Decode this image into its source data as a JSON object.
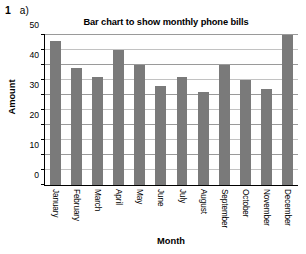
{
  "page": {
    "top_cut_text": "AAAAAA",
    "question_number": "1",
    "question_part": "a)"
  },
  "chart_data": {
    "type": "bar",
    "title": "Bar chart to show monthly phone bills",
    "xlabel": "Month",
    "ylabel": "Amount",
    "categories": [
      "January",
      "February",
      "March",
      "April",
      "May",
      "June",
      "July",
      "August",
      "September",
      "October",
      "November",
      "December"
    ],
    "values": [
      48,
      39,
      36,
      45,
      40,
      33,
      36,
      31,
      40,
      35,
      32,
      50
    ],
    "ylim": [
      0,
      50
    ],
    "ytick_labels": [
      "0",
      "10",
      "20",
      "30",
      "40",
      "50"
    ],
    "ytick_values": [
      0,
      10,
      20,
      30,
      40,
      50
    ],
    "minor_tick_values": [
      5,
      15,
      25,
      35,
      45
    ],
    "grid": true,
    "legend": false,
    "bar_color": "#7a7a7a",
    "grid_color": "#9a9a9a",
    "axis_color": "#000000"
  }
}
